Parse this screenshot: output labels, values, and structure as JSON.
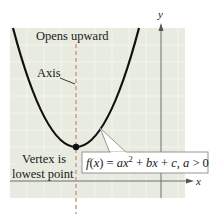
{
  "figure": {
    "labels": {
      "opens": "Opens upward",
      "axis": "Axis",
      "vertex_line1": "Vertex is",
      "vertex_line2": "lowest point",
      "x_axis": "x",
      "y_axis": "y"
    },
    "equation": {
      "f": "f",
      "open_paren": "(",
      "var": "x",
      "close_eq": ") = ",
      "a": "ax",
      "exp": "2",
      "plus_b": " + ",
      "b": "bx",
      "plus_c": " + ",
      "c": "c",
      "comma": ", ",
      "cond_a": "a",
      "cond": " > 0"
    },
    "colors": {
      "background": "#e8ebdf",
      "grid": "#f1f3ea",
      "curve": "#111111",
      "axis_of_symmetry": "#d9897f",
      "axes": "#6e6e6e",
      "callout_border": "#8a8a8a"
    }
  }
}
